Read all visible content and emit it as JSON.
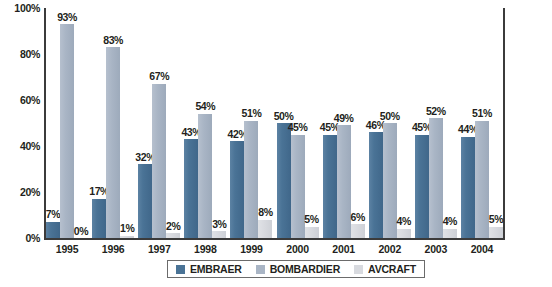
{
  "chart_data": {
    "type": "bar",
    "title": "",
    "subtitle": "",
    "xlabel": "",
    "ylabel": "",
    "ylim": [
      0,
      100
    ],
    "yticks": [
      "0%",
      "20%",
      "40%",
      "60%",
      "80%",
      "100%"
    ],
    "ytick_values": [
      0,
      20,
      40,
      60,
      80,
      100
    ],
    "grid": false,
    "legend_position": "bottom-center",
    "categories": [
      "1995",
      "1996",
      "1997",
      "1998",
      "1999",
      "2000",
      "2001",
      "2002",
      "2003",
      "2004"
    ],
    "series": [
      {
        "name": "EMBRAER",
        "color": "#4a7396",
        "values": [
          7,
          17,
          32,
          43,
          42,
          50,
          45,
          46,
          45,
          44
        ],
        "labels": [
          "7%",
          "17%",
          "32%",
          "43%",
          "42%",
          "50%",
          "45%",
          "46%",
          "45%",
          "44%"
        ]
      },
      {
        "name": "BOMBARDIER",
        "color": "#a9b5c5",
        "values": [
          93,
          83,
          67,
          54,
          51,
          45,
          49,
          50,
          52,
          51
        ],
        "labels": [
          "93%",
          "83%",
          "67%",
          "54%",
          "51%",
          "45%",
          "49%",
          "50%",
          "52%",
          "51%"
        ]
      },
      {
        "name": "AVCRAFT",
        "color": "#d8dadf",
        "values": [
          0,
          1,
          2,
          3,
          8,
          5,
          6,
          4,
          4,
          5
        ],
        "labels": [
          "0%",
          "1%",
          "2%",
          "3%",
          "8%",
          "5%",
          "6%",
          "4%",
          "4%",
          "5%"
        ]
      }
    ]
  },
  "legend": {
    "items": [
      {
        "label": "EMBRAER",
        "color": "#4a7396"
      },
      {
        "label": "BOMBARDIER",
        "color": "#a9b5c5"
      },
      {
        "label": "AVCRAFT",
        "color": "#d8dadf"
      }
    ]
  },
  "axis": {
    "left_color": "#3b3b3b",
    "bottom_color": "#3b3b3b"
  }
}
